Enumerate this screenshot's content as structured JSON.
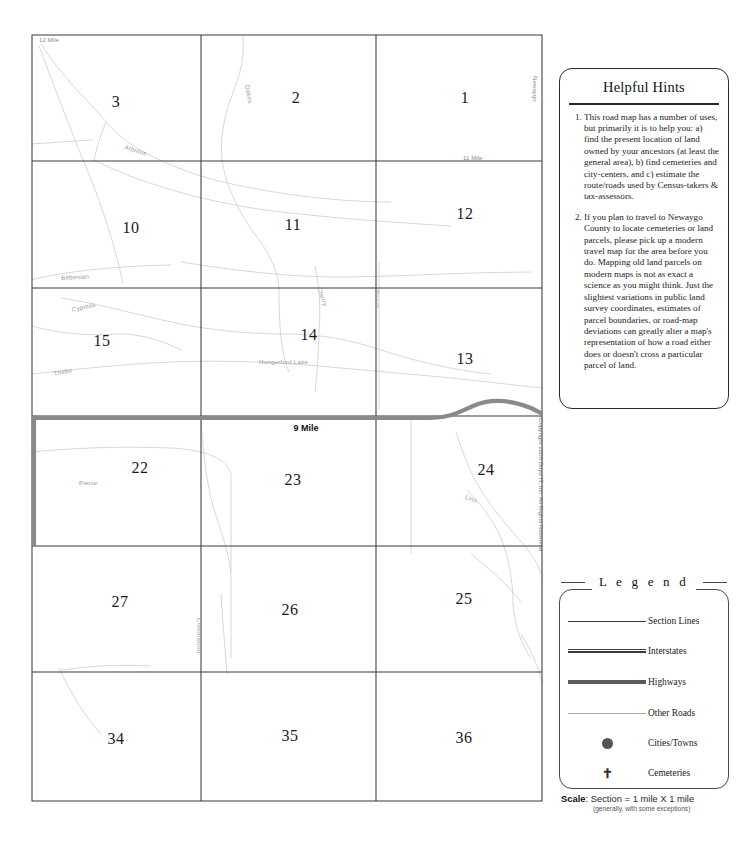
{
  "map": {
    "title": "Newaygo County Township Section Road Map",
    "boundary_labels": [
      {
        "name": "12 Mile",
        "x": 8,
        "y": 5
      },
      {
        "name": "11 Mile",
        "x": 432,
        "y": 126
      },
      {
        "name": "Newaygo",
        "x": 504,
        "y": 44
      }
    ],
    "highway_label": {
      "name": "9 Mile",
      "x": 275,
      "y": 391
    },
    "sections": [
      {
        "number": "3",
        "x": 85,
        "y": 68
      },
      {
        "number": "2",
        "x": 265,
        "y": 64
      },
      {
        "number": "1",
        "x": 434,
        "y": 64
      },
      {
        "number": "10",
        "x": 100,
        "y": 194
      },
      {
        "number": "11",
        "x": 262,
        "y": 191
      },
      {
        "number": "12",
        "x": 434,
        "y": 180
      },
      {
        "number": "15",
        "x": 71,
        "y": 307
      },
      {
        "number": "14",
        "x": 278,
        "y": 301
      },
      {
        "number": "13",
        "x": 434,
        "y": 325
      },
      {
        "number": "22",
        "x": 109,
        "y": 434
      },
      {
        "number": "23",
        "x": 262,
        "y": 446
      },
      {
        "number": "24",
        "x": 455,
        "y": 436
      },
      {
        "number": "27",
        "x": 89,
        "y": 568
      },
      {
        "number": "26",
        "x": 259,
        "y": 576
      },
      {
        "number": "25",
        "x": 433,
        "y": 565
      },
      {
        "number": "34",
        "x": 85,
        "y": 705
      },
      {
        "number": "35",
        "x": 259,
        "y": 702
      },
      {
        "number": "36",
        "x": 433,
        "y": 704
      }
    ],
    "road_names": [
      {
        "name": "Arbutus",
        "x": 95,
        "y": 109,
        "rotate": 18
      },
      {
        "name": "Oakes",
        "x": 220,
        "y": 50,
        "rotate": 80
      },
      {
        "name": "Bebenian",
        "x": 30,
        "y": 240,
        "rotate": -3
      },
      {
        "name": "Cypress",
        "x": 40,
        "y": 270,
        "rotate": -13
      },
      {
        "name": "Cherry",
        "x": 290,
        "y": 255,
        "rotate": 72
      },
      {
        "name": "Thebo",
        "x": 22,
        "y": 335,
        "rotate": -12
      },
      {
        "name": "Hungerford  Lake",
        "x": 228,
        "y": 324,
        "rotate": 0
      },
      {
        "name": "Beech",
        "x": 348,
        "y": 258,
        "rotate": 90
      },
      {
        "name": "Pierce",
        "x": 48,
        "y": 445,
        "rotate": 0
      },
      {
        "name": "Linn",
        "x": 436,
        "y": 459,
        "rotate": 22
      },
      {
        "name": "Cottonwood",
        "x": 170,
        "y": 585,
        "rotate": 90
      }
    ]
  },
  "hints": {
    "title": "Helpful Hints",
    "items": [
      "This road map has a number of uses, but primarily it is to help you: a) find the present location of land owned by your ancestors (at least the general area), b) find cemeteries and city-centers, and c) estimate the route/roads used by Census-takers & tax-assessors.",
      "If you plan to travel to Newaygo County to locate cemeteries or land parcels, please pick up a modern travel map for the area before you do. Mapping old land parcels on modern maps is not as exact a science as you might think. Just the slightest variations in public land survey coordinates, estimates of parcel boundaries, or road-map deviations can greatly alter a map's representation of how a road either does or doesn't cross a particular parcel of land."
    ]
  },
  "copyright": "Copyright 2008 Boyd IT, Inc. All Rights Reserved",
  "legend": {
    "title": "L e g e n d",
    "rows": [
      {
        "icon": "section-line-sample",
        "label": "Section Lines"
      },
      {
        "icon": "interstate-line-sample",
        "label": "Interstates"
      },
      {
        "icon": "highway-line-sample",
        "label": "Highways"
      },
      {
        "icon": "other-road-line-sample",
        "label": "Other Roads"
      },
      {
        "icon": "city-dot-sample",
        "label": "Cities/Towns"
      },
      {
        "icon": "cemetery-cross-sample",
        "label": "Cemeteries"
      }
    ]
  },
  "scale": {
    "label": "Scale",
    "value": "Section = 1 mile  X  1 mile",
    "note": "(generally, with some exceptions)"
  },
  "colors": {
    "section_line": "#3a3a3a",
    "highway": "#8a8a8a",
    "other_road": "#c9c9c9",
    "text": "#1a1a1a",
    "faint_label": "#9a9a9a"
  }
}
